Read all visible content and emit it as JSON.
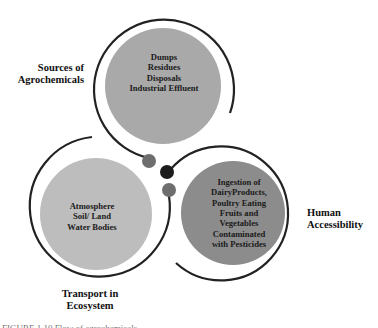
{
  "diagram": {
    "type": "three-circle cycle",
    "nodes": [
      {
        "id": "sources",
        "label_lines": [
          "Sources of",
          "Agrochemicals"
        ],
        "content_lines": [
          "Dumps",
          "Residues",
          "Disposals",
          "Industrial Effluent"
        ],
        "fill_color": "#a9a9a9"
      },
      {
        "id": "transport",
        "label_lines": [
          "Transport in",
          "Ecosystem"
        ],
        "content_lines": [
          "Atmosphere",
          "Soil/ Land",
          "Water Bodies"
        ],
        "fill_color": "#bdbdbd"
      },
      {
        "id": "human",
        "label_lines": [
          "Human",
          "Accessibility"
        ],
        "content_lines": [
          "Ingestion of",
          "DairyProducts,",
          "Poultry Eating",
          "Fruits and",
          "Vegetables",
          "Contaminated",
          "with Pesticides"
        ],
        "fill_color": "#8c8c8c"
      }
    ],
    "connector_dots": [
      {
        "color": "#6e6e6e"
      },
      {
        "color": "#1c1c1c"
      },
      {
        "color": "#6e6e6e"
      }
    ],
    "ring_color": "#222222"
  },
  "caption": {
    "text": "FIGURE 1.10   Flow of agrochemicals..."
  }
}
